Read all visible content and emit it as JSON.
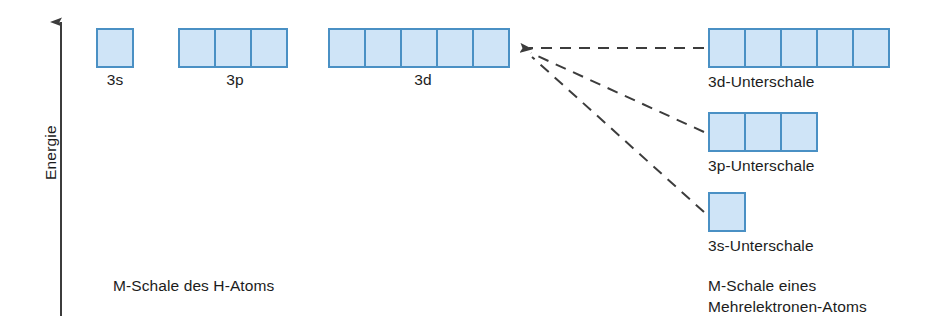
{
  "axis": {
    "label": "Energie"
  },
  "left_group": {
    "caption": "M-Schale des H-Atoms",
    "orbitals": [
      {
        "label": "3s",
        "cells": 1,
        "x": 96,
        "y": 28,
        "center_x": 115
      },
      {
        "label": "3p",
        "cells": 3,
        "x": 178,
        "y": 28,
        "center_x": 235
      },
      {
        "label": "3d",
        "cells": 5,
        "x": 328,
        "y": 28,
        "center_x": 423
      }
    ]
  },
  "right_group": {
    "caption": "M-Schale eines\nMehrelektronen-Atoms",
    "subshells": [
      {
        "label": "3d-Unterschale",
        "cells": 5,
        "x": 708,
        "y": 28,
        "label_y": 72
      },
      {
        "label": "3p-Unterschale",
        "cells": 3,
        "x": 708,
        "y": 112,
        "label_y": 156
      },
      {
        "label": "3s-Unterschale",
        "cells": 1,
        "x": 708,
        "y": 192,
        "label_y": 236
      }
    ]
  },
  "colors": {
    "cell_fill": "#cfe4f7",
    "cell_border": "#4a90c4",
    "line": "#3c3c3c",
    "text": "#1c1c1c"
  },
  "connectors": {
    "arrow_tip_x": 521,
    "arrow_tip_y": 48,
    "targets": [
      {
        "x": 704,
        "y": 48
      },
      {
        "x": 704,
        "y": 132
      },
      {
        "x": 704,
        "y": 212
      }
    ]
  }
}
